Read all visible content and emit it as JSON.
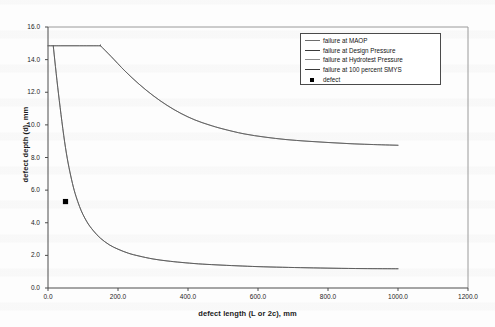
{
  "chart_data": {
    "type": "line",
    "title": "",
    "xlabel": "defect length (L or 2c), mm",
    "ylabel": "defect depth (d), mm",
    "xlim": [
      0.0,
      1200.0
    ],
    "ylim": [
      0.0,
      16.0
    ],
    "xticks": [
      "0.0",
      "200.0",
      "400.0",
      "600.0",
      "800.0",
      "1000.0",
      "1200.0"
    ],
    "yticks": [
      "0.0",
      "2.0",
      "4.0",
      "6.0",
      "8.0",
      "10.0",
      "12.0",
      "14.0",
      "16.0"
    ],
    "grid": false,
    "legend_position": "top-right",
    "series": [
      {
        "name": "failure at MAOP",
        "color": "#6e6e6e",
        "style": "solid",
        "x": [
          0,
          40,
          80,
          120,
          150,
          150,
          180,
          220,
          260,
          300,
          340,
          380,
          420,
          460,
          500,
          560,
          620,
          680,
          740,
          800,
          860,
          920,
          1000
        ],
        "y": [
          14.85,
          14.85,
          14.85,
          14.85,
          14.85,
          14.85,
          14.2,
          13.3,
          12.5,
          11.8,
          11.2,
          10.7,
          10.3,
          10.0,
          9.75,
          9.45,
          9.25,
          9.1,
          9.0,
          8.92,
          8.85,
          8.8,
          8.75
        ]
      },
      {
        "name": "failure at Design Pressure",
        "color": "#5a5a5a",
        "style": "solid",
        "x": [
          0,
          40,
          80,
          120,
          150,
          150,
          180,
          220,
          260,
          300,
          340,
          380,
          420,
          460,
          500,
          560,
          620,
          680,
          740,
          800,
          860,
          920,
          1000
        ],
        "y": [
          14.85,
          14.85,
          14.85,
          14.85,
          14.85,
          14.85,
          14.2,
          13.3,
          12.5,
          11.8,
          11.2,
          10.7,
          10.3,
          10.0,
          9.75,
          9.45,
          9.25,
          9.1,
          9.0,
          8.92,
          8.85,
          8.8,
          8.75
        ]
      },
      {
        "name": "failure at Hydrotest Pressure",
        "color": "#6a6a6a",
        "style": "solid",
        "x": [
          15,
          30,
          50,
          70,
          90,
          110,
          130,
          150,
          175,
          200,
          230,
          260,
          300,
          340,
          380,
          430,
          480,
          540,
          600,
          670,
          740,
          820,
          900,
          1000
        ],
        "y": [
          14.85,
          11.9,
          8.6,
          6.4,
          5.0,
          4.1,
          3.5,
          3.05,
          2.65,
          2.38,
          2.13,
          1.96,
          1.78,
          1.66,
          1.57,
          1.48,
          1.42,
          1.36,
          1.31,
          1.27,
          1.24,
          1.21,
          1.19,
          1.18
        ]
      },
      {
        "name": "failure at 100 percent SMYS",
        "color": "#555555",
        "style": "solid",
        "x": [
          15,
          30,
          50,
          70,
          90,
          110,
          130,
          150,
          175,
          200,
          230,
          260,
          300,
          340,
          380,
          430,
          480,
          540,
          600,
          670,
          740,
          820,
          900,
          1000
        ],
        "y": [
          14.85,
          11.9,
          8.6,
          6.4,
          5.0,
          4.1,
          3.5,
          3.05,
          2.65,
          2.38,
          2.13,
          1.96,
          1.78,
          1.66,
          1.57,
          1.48,
          1.42,
          1.36,
          1.31,
          1.27,
          1.24,
          1.21,
          1.19,
          1.18
        ]
      }
    ],
    "points": [
      {
        "name": "defect",
        "x": 50.0,
        "y": 5.3,
        "color": "#000000",
        "marker": "square"
      }
    ],
    "legend": [
      {
        "label": "failure at MAOP",
        "color": "#6e6e6e",
        "marker": "line"
      },
      {
        "label": "failure at Design Pressure",
        "color": "#3a3a3a",
        "marker": "line"
      },
      {
        "label": "failure at Hydrotest Pressure",
        "color": "#8a8a8a",
        "marker": "line"
      },
      {
        "label": "failure at 100 percent SMYS",
        "color": "#3a3a3a",
        "marker": "line"
      },
      {
        "label": "defect",
        "color": "#000000",
        "marker": "square"
      }
    ]
  }
}
